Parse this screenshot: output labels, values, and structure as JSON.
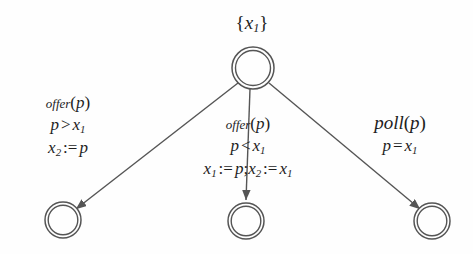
{
  "diagram": {
    "type": "state-transition-diagram",
    "background_color": "#fefefe",
    "stroke_color": "#555555",
    "text_color": "#1d1d1d",
    "start_state_set_label": "{x₁}",
    "nodes": [
      {
        "id": "source",
        "shape": "double-circle",
        "cx": 253,
        "cy": 68,
        "r": 21,
        "label": ""
      },
      {
        "id": "target-left",
        "shape": "double-circle",
        "cx": 63,
        "cy": 220,
        "r": 18,
        "label": ""
      },
      {
        "id": "target-middle",
        "shape": "double-circle",
        "cx": 246,
        "cy": 221,
        "r": 18,
        "label": ""
      },
      {
        "id": "target-right",
        "shape": "double-circle",
        "cx": 432,
        "cy": 221,
        "r": 18,
        "label": ""
      }
    ],
    "edges": [
      {
        "id": "edge-left",
        "from": "source",
        "to": "target-left",
        "action": "offer(p)",
        "guard": "p > x₁",
        "update": "x₂ := p"
      },
      {
        "id": "edge-middle",
        "from": "source",
        "to": "target-middle",
        "action": "offer(p)",
        "guard": "p < x₁",
        "update": "x₁ := p; x₂ := x₁"
      },
      {
        "id": "edge-right",
        "from": "source",
        "to": "target-right",
        "action": "poll(p)",
        "guard": "p = x₁",
        "update": ""
      }
    ],
    "labels": {
      "set_label": {
        "open_brace": "{",
        "var": "x",
        "sub": "1",
        "close_brace": "}"
      },
      "left": {
        "fn_name": "offer",
        "fn_arg_open": "(",
        "fn_arg": "p",
        "fn_arg_close": ")",
        "guard_lhs": "p",
        "guard_op": ">",
        "guard_rhs_var": "x",
        "guard_rhs_sub": "1",
        "upd_lhs_var": "x",
        "upd_lhs_sub": "2",
        "upd_op": ":=",
        "upd_rhs": "p"
      },
      "middle": {
        "fn_name": "offer",
        "fn_arg_open": "(",
        "fn_arg": "p",
        "fn_arg_close": ")",
        "guard_lhs": "p",
        "guard_op": "<",
        "guard_rhs_var": "x",
        "guard_rhs_sub": "1",
        "upd1_lhs_var": "x",
        "upd1_lhs_sub": "1",
        "upd1_op": ":=",
        "upd1_rhs": "p",
        "upd_sep": ";",
        "upd2_lhs_var": "x",
        "upd2_lhs_sub": "2",
        "upd2_op": ":=",
        "upd2_rhs_var": "x",
        "upd2_rhs_sub": "1"
      },
      "right": {
        "fn_name": "poll",
        "fn_arg_open": "(",
        "fn_arg": "p",
        "fn_arg_close": ")",
        "guard_lhs": "p",
        "guard_op": "=",
        "guard_rhs_var": "x",
        "guard_rhs_sub": "1"
      }
    }
  }
}
